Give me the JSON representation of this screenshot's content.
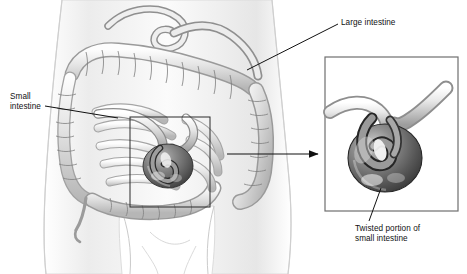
{
  "figure": {
    "background_color": "#ffffff",
    "ink_color": "#111111",
    "tissue_light": "#f2f2f2",
    "tissue_mid": "#c9c9c9",
    "tissue_dark": "#6a6a6a",
    "loop_dark": "#3a3a3a",
    "body_outline_color": "#d8d8d8"
  },
  "labels": {
    "large_intestine": "Large intestine",
    "small_intestine": "Small\nintestine",
    "twisted_portion": "Twisted portion of\nsmall intestine"
  },
  "callout": {
    "main_box": {
      "x": 130,
      "y": 117,
      "w": 80,
      "h": 90
    },
    "inset_box": {
      "x": 325,
      "y": 57,
      "w": 133,
      "h": 154
    },
    "arrow": {
      "x1": 227,
      "y1": 154,
      "x2": 320,
      "y2": 154
    }
  },
  "leader_lines": {
    "large_intestine": {
      "x1": 338,
      "y1": 24,
      "x2": 247,
      "y2": 70
    },
    "small_intestine": {
      "x1": 45,
      "y1": 106,
      "x2": 118,
      "y2": 117
    },
    "twisted_portion": {
      "x1": 381,
      "y1": 188,
      "x2": 370,
      "y2": 221
    }
  }
}
